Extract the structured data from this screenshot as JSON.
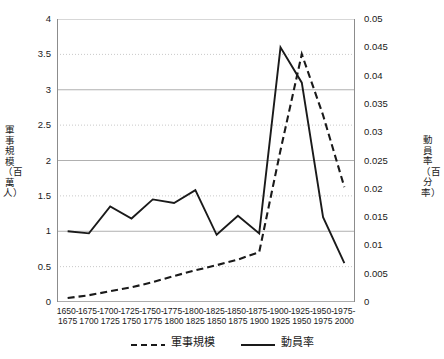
{
  "chart_data": {
    "type": "line",
    "title": "",
    "categories": [
      "1650-1675",
      "1675-1700",
      "1700-1725",
      "1725-1750",
      "1750-1775",
      "1775-1800",
      "1800-1825",
      "1825-1850",
      "1850-1875",
      "1875-1900",
      "1900-1925",
      "1925-1950",
      "1950-1975",
      "1975-2000"
    ],
    "series": [
      {
        "name": "軍事規模",
        "style": "dashed",
        "axis": "right",
        "color": "#1a1a1a",
        "values": [
          0.0007,
          0.0012,
          0.0019,
          0.0026,
          0.0035,
          0.0046,
          0.0056,
          0.0065,
          0.0075,
          0.0088,
          0.0268,
          0.0438,
          0.033,
          0.0203
        ]
      },
      {
        "name": "動員率",
        "style": "solid",
        "axis": "left",
        "color": "#1a1a1a",
        "values": [
          1.0,
          0.97,
          1.35,
          1.18,
          1.45,
          1.4,
          1.58,
          0.95,
          1.22,
          0.97,
          3.6,
          3.1,
          1.2,
          0.55
        ]
      }
    ],
    "left_axis": {
      "label": "軍事規模（百萬人）",
      "ticks": [
        "0",
        "0.5",
        "1",
        "1.5",
        "2",
        "2.5",
        "3",
        "3.5",
        "4"
      ],
      "min": 0,
      "max": 4,
      "step": 0.5
    },
    "right_axis": {
      "label": "動員率（百分率）",
      "ticks": [
        "0",
        "0.005",
        "0.01",
        "0.015",
        "0.02",
        "0.025",
        "0.03",
        "0.035",
        "0.04",
        "0.045",
        "0.05"
      ],
      "min": 0,
      "max": 0.05,
      "step": 0.005
    },
    "xlabel": "",
    "grid": true,
    "legend_position": "bottom"
  },
  "legend": {
    "items": [
      {
        "label": "軍事規模",
        "style": "dashed"
      },
      {
        "label": "動員率",
        "style": "solid"
      }
    ]
  }
}
